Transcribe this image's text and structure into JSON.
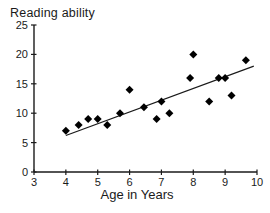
{
  "figure": {
    "background": "#ffffff"
  },
  "chart_data": {
    "type": "scatter",
    "title": "Reading ability",
    "xlabel": "Age in Years",
    "ylabel": "Reading ability",
    "xlim": [
      3,
      10
    ],
    "ylim": [
      0,
      25
    ],
    "x_ticks": [
      "3",
      "4",
      "5",
      "6",
      "7",
      "8",
      "9",
      "10"
    ],
    "x_tick_values": [
      3,
      4,
      5,
      6,
      7,
      8,
      9,
      10
    ],
    "y_ticks": [
      "0",
      "5",
      "10",
      "15",
      "20",
      "25"
    ],
    "y_tick_values": [
      0,
      5,
      10,
      15,
      20,
      25
    ],
    "grid": false,
    "legend_position": "none",
    "marker": "diamond",
    "series": [
      {
        "name": "reading-ability-vs-age",
        "points": [
          [
            4.0,
            7
          ],
          [
            4.4,
            8
          ],
          [
            4.7,
            9
          ],
          [
            5.0,
            9
          ],
          [
            5.3,
            8
          ],
          [
            5.7,
            10
          ],
          [
            6.0,
            14
          ],
          [
            6.45,
            11
          ],
          [
            6.85,
            9
          ],
          [
            7.0,
            12
          ],
          [
            7.25,
            10
          ],
          [
            7.9,
            16
          ],
          [
            8.0,
            20
          ],
          [
            8.5,
            12
          ],
          [
            8.8,
            16
          ],
          [
            9.0,
            16
          ],
          [
            9.2,
            13
          ],
          [
            9.65,
            19
          ]
        ]
      }
    ],
    "trendline": {
      "type": "linear",
      "x_start": 4.0,
      "y_start": 6.2,
      "x_end": 9.9,
      "y_end": 18.0
    },
    "colors": {
      "marker": "#000000",
      "trend_line": "#1a1a1a",
      "axis": "#1a1a1a",
      "text": "#1a1a1a",
      "background": "#ffffff"
    }
  }
}
